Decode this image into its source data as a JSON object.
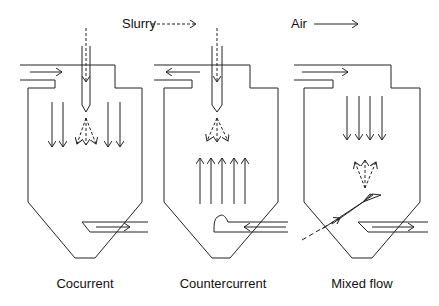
{
  "legend": {
    "slurry_label": "Slurry",
    "slurry_line_style": "dashed",
    "air_label": "Air",
    "air_line_style": "solid"
  },
  "panels": [
    {
      "id": "cocurrent",
      "caption": "Cocurrent",
      "air_inlet": "top-left, flowing right",
      "air_flow": "downward",
      "spray": "from top nozzle, downward",
      "outlet": "bottom-right, flowing right"
    },
    {
      "id": "countercurrent",
      "caption": "Countercurrent",
      "air_inlet": "bottom-right, flowing left",
      "air_flow": "upward",
      "spray": "from top nozzle, downward",
      "outlet": "top-left, flowing left"
    },
    {
      "id": "mixed-flow",
      "caption": "Mixed flow",
      "air_inlet": "top-left, flowing right",
      "air_flow": "downward",
      "spray": "from bottom-left inclined nozzle, upward",
      "outlet": "bottom-right, flowing right"
    }
  ],
  "colors": {
    "line": "#222222",
    "background": "#ffffff"
  }
}
